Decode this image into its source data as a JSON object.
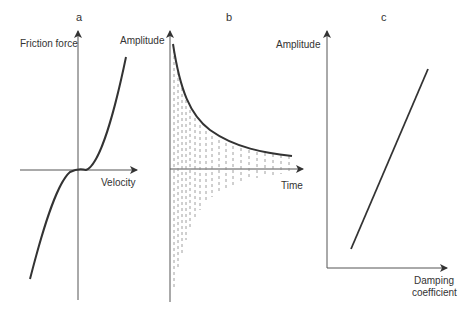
{
  "figure": {
    "panels": [
      {
        "letter": "a",
        "y_label": "Friction force",
        "x_label": "Velocity",
        "description": "Cubic-like friction force vs velocity curve passing through origin"
      },
      {
        "letter": "b",
        "y_label": "Amplitude",
        "x_label": "Time",
        "description": "Decaying amplitude envelope with dashed oscillation fill"
      },
      {
        "letter": "c",
        "y_label": "Amplitude",
        "x_label_line1": "Damping",
        "x_label_line2": "coefficient",
        "description": "Linear increase of amplitude with damping coefficient"
      }
    ]
  },
  "colors": {
    "axis": "#555555",
    "curve": "#333333",
    "dash": "#888888",
    "text": "#333333"
  }
}
